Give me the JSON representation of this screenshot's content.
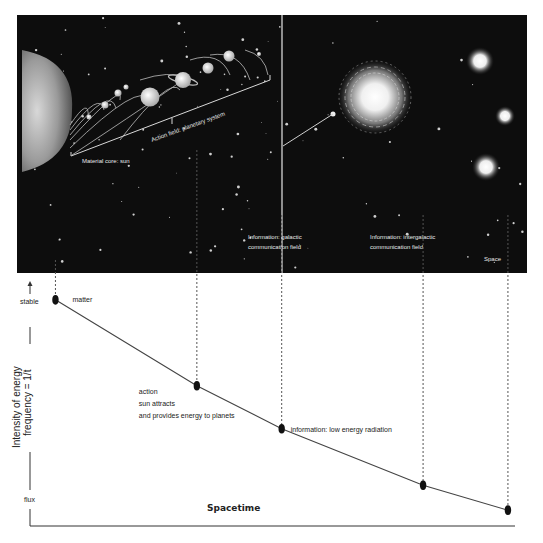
{
  "panel": {
    "labels": {
      "material_core": "Material core: sun",
      "action_field": "Action field: planetary system",
      "galactic_line1": "Information: galactic",
      "galactic_line2": "communication field",
      "intergalactic_line1": "Information: intergalactic",
      "intergalactic_line2": "communication field",
      "space": "Space"
    }
  },
  "colors": {
    "panel_bg": "#0d0d0d",
    "line": "#444444",
    "point": "#111111",
    "text_dark": "#222222",
    "text_light": "#e8e8e8"
  },
  "chart_data": {
    "type": "line",
    "title": "",
    "xlabel": "Spacetime",
    "ylabel_line1": "Intensity of energy",
    "ylabel_line2": "frequency = 1/t",
    "y_top_label": "stable",
    "y_bottom_label": "flux",
    "x": [
      0,
      1,
      1.6,
      2.6,
      3.2
    ],
    "y": [
      1.0,
      0.62,
      0.43,
      0.18,
      0.07
    ],
    "ylim": [
      0,
      1.07
    ],
    "xlim": [
      -0.18,
      3.25
    ],
    "grid": false,
    "points": [
      {
        "label": "matter",
        "annotation_lines": [
          "matter"
        ]
      },
      {
        "label": "action",
        "annotation_lines": [
          "action",
          "sun attracts",
          "and provides energy to planets"
        ]
      },
      {
        "label": "information",
        "annotation_lines": [
          "information: low energy radiation"
        ]
      },
      {
        "label": "intergalactic",
        "annotation_lines": []
      },
      {
        "label": "space",
        "annotation_lines": []
      }
    ]
  }
}
